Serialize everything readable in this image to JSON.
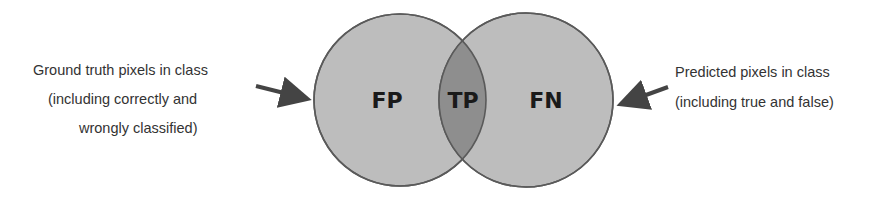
{
  "diagram": {
    "type": "venn",
    "circles": [
      {
        "id": "ground-truth",
        "cx": 400,
        "cy": 100,
        "r": 86
      },
      {
        "id": "predicted",
        "cx": 526,
        "cy": 100,
        "r": 87
      }
    ],
    "regions": {
      "left": "FP",
      "overlap": "TP",
      "right": "FN"
    },
    "labels": {
      "left": {
        "lines": [
          "Ground truth pixels in class",
          "(including correctly and",
          "wrongly classified)"
        ]
      },
      "right": {
        "lines": [
          "Predicted pixels in class",
          "(including true and false)"
        ]
      }
    },
    "colors": {
      "circle_fill": "#bdbdbd",
      "overlap_fill": "#8e8e8e",
      "stroke": "#5a5a5a",
      "arrow": "#444444",
      "text": "#333333"
    }
  }
}
